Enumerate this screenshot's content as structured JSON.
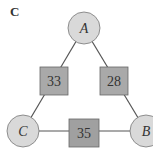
{
  "panel_label": "C",
  "nodes": [
    {
      "id": "A",
      "label": "A"
    },
    {
      "id": "B",
      "label": "B"
    },
    {
      "id": "C",
      "label": "C"
    }
  ],
  "edges": [
    {
      "from": "A",
      "to": "C",
      "weight": "33"
    },
    {
      "from": "A",
      "to": "B",
      "weight": "28"
    },
    {
      "from": "C",
      "to": "B",
      "weight": "35"
    }
  ],
  "colors": {
    "node_fill": "#d9d9d9",
    "weight_fill": "#a9a9a9",
    "stroke": "#555555",
    "text": "#333333"
  }
}
